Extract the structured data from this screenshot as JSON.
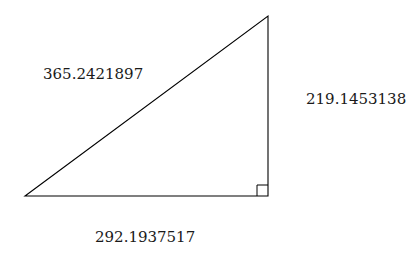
{
  "diagram": {
    "type": "right-triangle",
    "labels": {
      "hypotenuse": "365.2421897",
      "vertical_leg": "219.1453138",
      "base": "292.1937517"
    },
    "right_angle_marker": true,
    "colors": {
      "stroke": "#000000",
      "background": "#ffffff",
      "text": "#1a1a1a"
    }
  }
}
